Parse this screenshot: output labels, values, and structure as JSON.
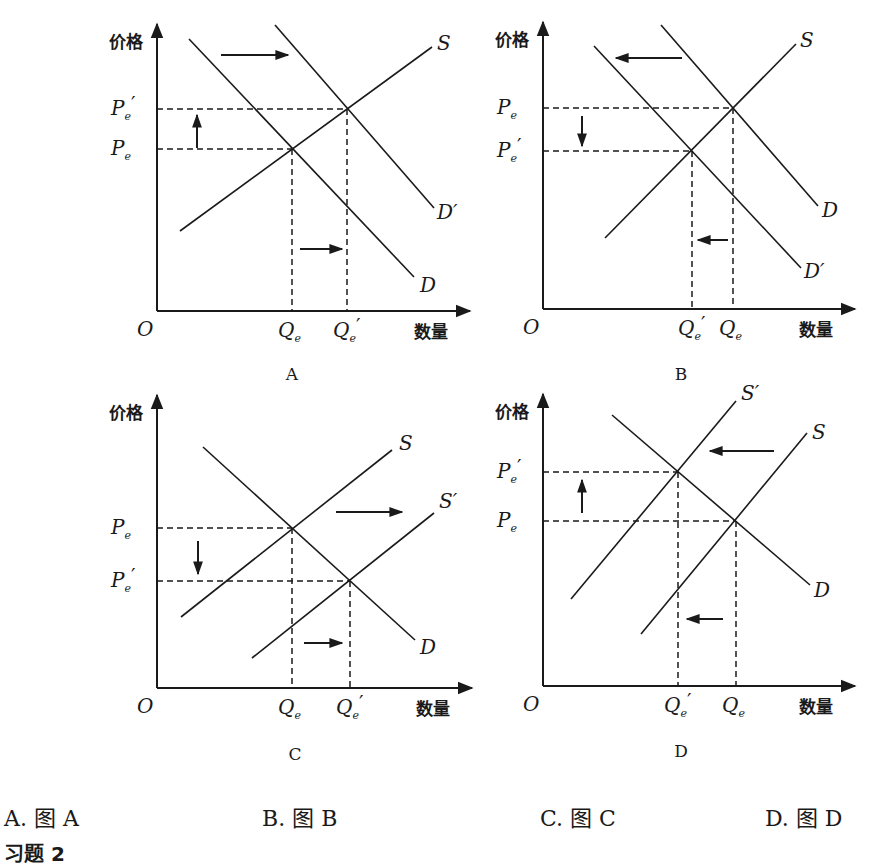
{
  "labels": {
    "price_axis": "价格",
    "quantity_axis": "数量",
    "origin": "O"
  },
  "options": [
    {
      "letter": "A.",
      "text": "图 A"
    },
    {
      "letter": "B.",
      "text": "图 B"
    },
    {
      "letter": "C.",
      "text": "图 C"
    },
    {
      "letter": "D.",
      "text": "图 D"
    }
  ],
  "exercise_heading": "习题 2",
  "chart_data": [
    {
      "type": "line",
      "caption": "A",
      "title": "Demand increase (D shifts right to D′)",
      "xlabel": "数量",
      "ylabel": "价格",
      "axes": {
        "origin": [
          157,
          311
        ],
        "y_top": 24,
        "x_right": 470
      },
      "curves": [
        {
          "name": "S",
          "from": [
            180,
            231
          ],
          "to": [
            432,
            47
          ],
          "label_pos": [
            437,
            50
          ]
        },
        {
          "name": "D",
          "from": [
            189,
            39
          ],
          "to": [
            414,
            277
          ],
          "label_pos": [
            420,
            292
          ]
        },
        {
          "name": "D′",
          "from": [
            275,
            25
          ],
          "to": [
            434,
            208
          ],
          "label_pos": [
            437,
            219
          ]
        }
      ],
      "equilibria": [
        {
          "price_label": "Pe",
          "qty_label": "Qe",
          "point": [
            292,
            149
          ]
        },
        {
          "price_label": "Pe′",
          "qty_label": "Qe′",
          "point": [
            347,
            109
          ]
        }
      ],
      "price_ticks": [
        {
          "main": "P",
          "sub": "e",
          "prime": "′",
          "y": 109
        },
        {
          "main": "P",
          "sub": "e",
          "prime": "",
          "y": 149
        }
      ],
      "qty_ticks": [
        {
          "main": "Q",
          "sub": "e",
          "prime": "",
          "x": 292
        },
        {
          "main": "Q",
          "sub": "e",
          "prime": "′",
          "x": 347
        }
      ],
      "shift_arrows": [
        {
          "from": [
            221,
            55
          ],
          "to": [
            288,
            55
          ],
          "meaning": "demand shifts right"
        },
        {
          "from": [
            300,
            249
          ],
          "to": [
            342,
            249
          ],
          "meaning": "quantity increases"
        },
        {
          "from": [
            197,
            148
          ],
          "to": [
            197,
            115
          ],
          "meaning": "price rises"
        }
      ],
      "caption_pos": [
        292,
        380
      ]
    },
    {
      "type": "line",
      "caption": "B",
      "title": "Demand decrease (D shifts left to D′)",
      "xlabel": "数量",
      "ylabel": "价格",
      "axes": {
        "origin": [
          543,
          309
        ],
        "y_top": 22,
        "x_right": 855
      },
      "curves": [
        {
          "name": "S",
          "from": [
            605,
            238
          ],
          "to": [
            796,
            44
          ],
          "label_pos": [
            800,
            47
          ]
        },
        {
          "name": "D",
          "from": [
            661,
            25
          ],
          "to": [
            818,
            206
          ],
          "label_pos": [
            822,
            217
          ]
        },
        {
          "name": "D′",
          "from": [
            594,
            46
          ],
          "to": [
            801,
            268
          ],
          "label_pos": [
            804,
            278
          ]
        }
      ],
      "equilibria": [
        {
          "price_label": "Pe",
          "qty_label": "Qe",
          "point": [
            733,
            108
          ]
        },
        {
          "price_label": "Pe′",
          "qty_label": "Qe′",
          "point": [
            692,
            151
          ]
        }
      ],
      "price_ticks": [
        {
          "main": "P",
          "sub": "e",
          "prime": "",
          "y": 108
        },
        {
          "main": "P",
          "sub": "e",
          "prime": "′",
          "y": 151
        }
      ],
      "qty_ticks": [
        {
          "main": "Q",
          "sub": "e",
          "prime": "′",
          "x": 692
        },
        {
          "main": "Q",
          "sub": "e",
          "prime": "",
          "x": 733
        }
      ],
      "shift_arrows": [
        {
          "from": [
            682,
            58
          ],
          "to": [
            616,
            58
          ],
          "meaning": "demand shifts left"
        },
        {
          "from": [
            728,
            240
          ],
          "to": [
            698,
            240
          ],
          "meaning": "quantity decreases"
        },
        {
          "from": [
            582,
            116
          ],
          "to": [
            582,
            146
          ],
          "meaning": "price falls"
        }
      ],
      "caption_pos": [
        681,
        380
      ]
    },
    {
      "type": "line",
      "caption": "C",
      "title": "Supply increase (S shifts right to S′)",
      "xlabel": "数量",
      "ylabel": "价格",
      "axes": {
        "origin": [
          157,
          688
        ],
        "y_top": 395,
        "x_right": 472
      },
      "curves": [
        {
          "name": "S",
          "from": [
            181,
            617
          ],
          "to": [
            392,
            450
          ],
          "label_pos": [
            399,
            450
          ]
        },
        {
          "name": "S′",
          "from": [
            252,
            658
          ],
          "to": [
            434,
            513
          ],
          "label_pos": [
            439,
            508
          ]
        },
        {
          "name": "D",
          "from": [
            203,
            447
          ],
          "to": [
            415,
            640
          ],
          "label_pos": [
            420,
            654
          ]
        }
      ],
      "equilibria": [
        {
          "price_label": "Pe",
          "qty_label": "Qe",
          "point": [
            292,
            528
          ]
        },
        {
          "price_label": "Pe′",
          "qty_label": "Qe′",
          "point": [
            350,
            581
          ]
        }
      ],
      "price_ticks": [
        {
          "main": "P",
          "sub": "e",
          "prime": "",
          "y": 528
        },
        {
          "main": "P",
          "sub": "e",
          "prime": "′",
          "y": 581
        }
      ],
      "qty_ticks": [
        {
          "main": "Q",
          "sub": "e",
          "prime": "",
          "x": 292
        },
        {
          "main": "Q",
          "sub": "e",
          "prime": "′",
          "x": 350
        }
      ],
      "shift_arrows": [
        {
          "from": [
            336,
            512
          ],
          "to": [
            402,
            512
          ],
          "meaning": "supply shifts right"
        },
        {
          "from": [
            304,
            643
          ],
          "to": [
            342,
            643
          ],
          "meaning": "quantity increases"
        },
        {
          "from": [
            198,
            541
          ],
          "to": [
            198,
            574
          ],
          "meaning": "price falls"
        }
      ],
      "caption_pos": [
        295,
        760
      ]
    },
    {
      "type": "line",
      "caption": "D",
      "title": "Supply decrease (S shifts left to S′)",
      "xlabel": "数量",
      "ylabel": "价格",
      "axes": {
        "origin": [
          543,
          686
        ],
        "y_top": 394,
        "x_right": 855
      },
      "curves": [
        {
          "name": "S′",
          "from": [
            571,
            599
          ],
          "to": [
            736,
            401
          ],
          "label_pos": [
            741,
            400
          ]
        },
        {
          "name": "S",
          "from": [
            641,
            634
          ],
          "to": [
            807,
            433
          ],
          "label_pos": [
            812,
            439
          ]
        },
        {
          "name": "D",
          "from": [
            612,
            415
          ],
          "to": [
            810,
            585
          ],
          "label_pos": [
            814,
            597
          ]
        }
      ],
      "equilibria": [
        {
          "price_label": "Pe′",
          "qty_label": "Qe′",
          "point": [
            678,
            472
          ]
        },
        {
          "price_label": "Pe",
          "qty_label": "Qe",
          "point": [
            736,
            521
          ]
        }
      ],
      "price_ticks": [
        {
          "main": "P",
          "sub": "e",
          "prime": "′",
          "y": 472
        },
        {
          "main": "P",
          "sub": "e",
          "prime": "",
          "y": 521
        }
      ],
      "qty_ticks": [
        {
          "main": "Q",
          "sub": "e",
          "prime": "′",
          "x": 678
        },
        {
          "main": "Q",
          "sub": "e",
          "prime": "",
          "x": 736
        }
      ],
      "shift_arrows": [
        {
          "from": [
            774,
            451
          ],
          "to": [
            710,
            451
          ],
          "meaning": "supply shifts left"
        },
        {
          "from": [
            723,
            619
          ],
          "to": [
            687,
            619
          ],
          "meaning": "quantity decreases"
        },
        {
          "from": [
            582,
            513
          ],
          "to": [
            582,
            480
          ],
          "meaning": "price rises"
        }
      ],
      "caption_pos": [
        681,
        757
      ]
    }
  ]
}
